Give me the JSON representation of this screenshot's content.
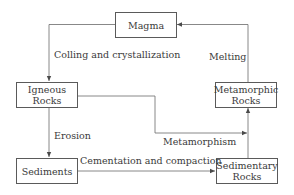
{
  "diagram": {
    "nodes": {
      "magma": {
        "line1": "Magma"
      },
      "igneous": {
        "line1": "Igneous",
        "line2": "Rocks"
      },
      "metamorphic": {
        "line1": "Metamorphic",
        "line2": "Rocks"
      },
      "sediments": {
        "line1": "Sediments"
      },
      "sedimentary": {
        "line1": "Sedimentary",
        "line2": "Rocks"
      }
    },
    "edges": {
      "magma_to_igneous": "Colling and crystallization",
      "metamorphic_to_magma": "Melting",
      "igneous_to_sediments": "Erosion",
      "igneous_to_metamorphic": "Metamorphism",
      "sediments_to_sedimentary": "Cementation and compaction"
    },
    "colors": {
      "line": "#5a5a5a",
      "text": "#3a3a3a",
      "background": "#ffffff"
    }
  }
}
